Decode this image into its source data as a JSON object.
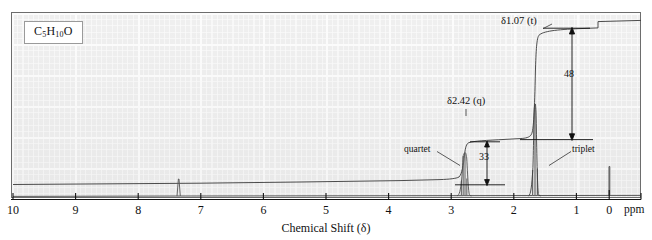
{
  "figure": {
    "type": "nmr-spectrum",
    "formula_html": "C<sub>5</sub>H<sub>10</sub>O",
    "formula_text": "C5H10O"
  },
  "axis": {
    "title": "Chemical Shift (δ)",
    "unit_label": "ppm",
    "ticks": [
      "10",
      "9",
      "8",
      "7",
      "6",
      "5",
      "4",
      "3",
      "2",
      "1",
      "0"
    ],
    "min_ppm": 0,
    "max_ppm": 10,
    "direction": "reversed"
  },
  "annotations": {
    "quartet_shift": "δ2.42 (q)",
    "triplet_shift": "δ1.07 (t)",
    "quartet_name": "quartet",
    "triplet_name": "triplet",
    "quartet_integral": "33",
    "triplet_integral": "48"
  },
  "chart_data": {
    "type": "line",
    "title": "",
    "xlabel": "Chemical Shift (δ)",
    "ylabel": "",
    "xlim": [
      10,
      0
    ],
    "ylim": [
      0,
      100
    ],
    "grid": true,
    "legend": "none",
    "xtick_labels": [
      "10",
      "9",
      "8",
      "7",
      "6",
      "5",
      "4",
      "3",
      "2",
      "1",
      "0"
    ],
    "xtick_values": [
      10,
      9,
      8,
      7,
      6,
      5,
      4,
      3,
      2,
      1,
      0
    ],
    "series": [
      {
        "name": "spectrum",
        "peaks": [
          {
            "shift_ppm": 7.26,
            "label": "",
            "multiplicity": "s",
            "rel_height": 9,
            "note": "residual solvent"
          },
          {
            "shift_ppm": 2.42,
            "label": "δ2.42 (q)",
            "multiplicity": "quartet",
            "rel_height": 62,
            "protons": 4
          },
          {
            "shift_ppm": 1.07,
            "label": "δ1.07 (t)",
            "multiplicity": "triplet",
            "rel_height": 92,
            "protons": 6
          },
          {
            "shift_ppm": 0.0,
            "label": "",
            "multiplicity": "s",
            "rel_height": 16,
            "note": "TMS reference"
          }
        ]
      },
      {
        "name": "integration",
        "steps": [
          {
            "shift_ppm": 2.42,
            "rise": 33,
            "label": "33"
          },
          {
            "shift_ppm": 1.07,
            "rise": 48,
            "label": "48"
          }
        ]
      }
    ]
  }
}
